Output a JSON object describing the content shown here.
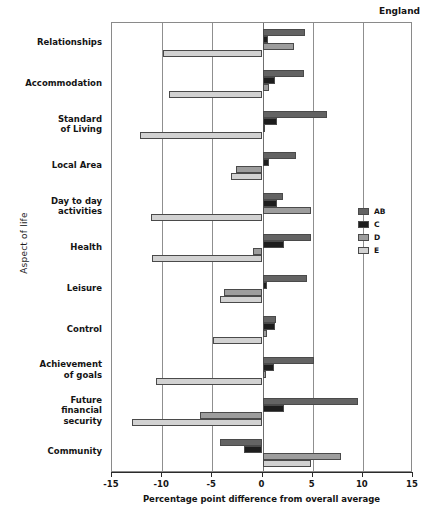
{
  "chart_data": {
    "type": "bar",
    "orientation": "horizontal",
    "title": "",
    "annotation": "England",
    "xlabel": "Percentage point difference from overall average",
    "ylabel": "Aspect of life",
    "xlim": [
      -15,
      15
    ],
    "xticks": [
      -15,
      -10,
      -5,
      0,
      5,
      10,
      15
    ],
    "xticklabels": [
      "-15",
      "-10",
      "-5",
      "0",
      "5",
      "10",
      "15"
    ],
    "grid": true,
    "legend_position": "right",
    "categories": [
      "Relationships",
      "Accommodation",
      "Standard\nof Living",
      "Local Area",
      "Day to day\nactivities",
      "Health",
      "Leisure",
      "Control",
      "Achievement\nof goals",
      "Future\nfinancial\nsecurity",
      "Community"
    ],
    "series": [
      {
        "name": "AB",
        "color": "#636363",
        "values": [
          4.2,
          4.1,
          6.4,
          3.3,
          2.0,
          4.8,
          4.4,
          1.3,
          5.1,
          9.5,
          -4.2
        ]
      },
      {
        "name": "C",
        "color": "#1d1d1d",
        "values": [
          0.5,
          1.2,
          1.4,
          0.6,
          1.4,
          2.1,
          0.4,
          1.2,
          1.1,
          2.1,
          -1.8
        ]
      },
      {
        "name": "D",
        "color": "#9d9d9d",
        "values": [
          3.1,
          0.6,
          0.2,
          -2.6,
          4.8,
          -0.9,
          -3.8,
          0.4,
          0.3,
          -6.2,
          7.8
        ]
      },
      {
        "name": "E",
        "color": "#d2d2d2",
        "values": [
          -9.9,
          -9.3,
          -12.2,
          -3.1,
          -11.1,
          -11.0,
          -4.2,
          -4.9,
          -10.6,
          -13.0,
          4.8
        ]
      }
    ]
  }
}
